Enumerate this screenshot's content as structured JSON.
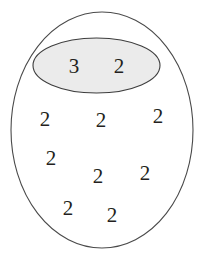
{
  "figure": {
    "width": 204,
    "height": 264,
    "background_color": "#ffffff"
  },
  "shapes": {
    "outer_ellipse": {
      "name": "outer-set-boundary",
      "cx": 102,
      "cy": 130,
      "rx": 91,
      "ry": 118,
      "fill_color": "#ffffff",
      "stroke_color": "#4a4a4a",
      "stroke_width": 1.1
    },
    "inner_ellipse": {
      "name": "inner-shaded-subset",
      "cx": 96.5,
      "cy": 65.5,
      "rx": 63.5,
      "ry": 27.5,
      "fill_color": "#ebebeb",
      "stroke_color": "#3d3d3d",
      "stroke_width": 1.1
    }
  },
  "labels": [
    {
      "id": "label-inner-1",
      "text": "3",
      "x": 74,
      "y": 67,
      "region": "inner"
    },
    {
      "id": "label-inner-2",
      "text": "2",
      "x": 119,
      "y": 67,
      "region": "inner"
    },
    {
      "id": "label-outer-1",
      "text": "2",
      "x": 45,
      "y": 120,
      "region": "outer"
    },
    {
      "id": "label-outer-2",
      "text": "2",
      "x": 101,
      "y": 121,
      "region": "outer"
    },
    {
      "id": "label-outer-3",
      "text": "2",
      "x": 158,
      "y": 117,
      "region": "outer"
    },
    {
      "id": "label-outer-4",
      "text": "2",
      "x": 51,
      "y": 159,
      "region": "outer"
    },
    {
      "id": "label-outer-5",
      "text": "2",
      "x": 98,
      "y": 177,
      "region": "outer"
    },
    {
      "id": "label-outer-6",
      "text": "2",
      "x": 145,
      "y": 174,
      "region": "outer"
    },
    {
      "id": "label-outer-7",
      "text": "2",
      "x": 68,
      "y": 209,
      "region": "outer"
    },
    {
      "id": "label-outer-8",
      "text": "2",
      "x": 112,
      "y": 216,
      "region": "outer"
    }
  ]
}
